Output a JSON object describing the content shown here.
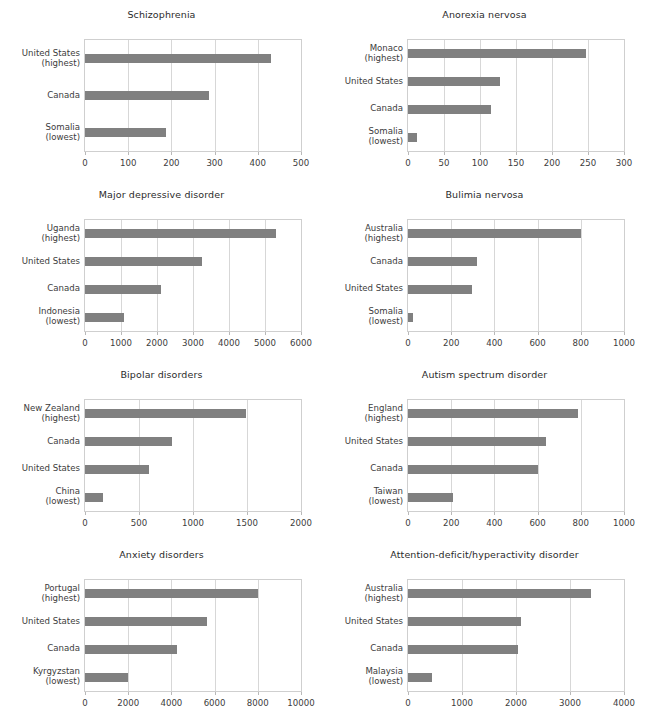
{
  "figure": {
    "bar_color": "#808080",
    "axis_color": "#cfcfcf",
    "grid_color": "#d7d7d7",
    "background": "#ffffff",
    "layout": "4 rows x 2 columns of horizontal bar charts"
  },
  "chart_data": [
    {
      "type": "bar",
      "orientation": "horizontal",
      "title": "Schizophrenia",
      "xlabel": "",
      "ylabel": "",
      "xlim": [
        0,
        500
      ],
      "ticks": [
        0,
        100,
        200,
        300,
        400,
        500
      ],
      "grid": true,
      "legend": "none",
      "categories": [
        "United States\n(highest)",
        "Canada",
        "Somalia\n(lowest)"
      ],
      "category_lines": [
        [
          "United States",
          "(highest)"
        ],
        [
          "Canada",
          ""
        ],
        [
          "Somalia",
          "(lowest)"
        ]
      ],
      "values": [
        430,
        288,
        188
      ]
    },
    {
      "type": "bar",
      "orientation": "horizontal",
      "title": "Anorexia nervosa",
      "xlabel": "",
      "ylabel": "",
      "xlim": [
        0,
        300
      ],
      "ticks": [
        0,
        50,
        100,
        150,
        200,
        250,
        300
      ],
      "grid": true,
      "legend": "none",
      "categories": [
        "Monaco\n(highest)",
        "United States",
        "Canada",
        "Somalia\n(lowest)"
      ],
      "category_lines": [
        [
          "Monaco",
          "(highest)"
        ],
        [
          "United States",
          ""
        ],
        [
          "Canada",
          ""
        ],
        [
          "Somalia",
          "(lowest)"
        ]
      ],
      "values": [
        247,
        128,
        115,
        13
      ]
    },
    {
      "type": "bar",
      "orientation": "horizontal",
      "title": "Major depressive disorder",
      "xlabel": "",
      "ylabel": "",
      "xlim": [
        0,
        6000
      ],
      "ticks": [
        0,
        1000,
        2000,
        3000,
        4000,
        5000,
        6000
      ],
      "grid": true,
      "legend": "none",
      "categories": [
        "Uganda\n(highest)",
        "United States",
        "Canada",
        "Indonesia\n(lowest)"
      ],
      "category_lines": [
        [
          "Uganda",
          "(highest)"
        ],
        [
          "United States",
          ""
        ],
        [
          "Canada",
          ""
        ],
        [
          "Indonesia",
          "(lowest)"
        ]
      ],
      "values": [
        5300,
        3250,
        2120,
        1070
      ]
    },
    {
      "type": "bar",
      "orientation": "horizontal",
      "title": "Bulimia nervosa",
      "xlabel": "",
      "ylabel": "",
      "xlim": [
        0,
        1000
      ],
      "ticks": [
        0,
        200,
        400,
        600,
        800,
        1000
      ],
      "grid": true,
      "legend": "none",
      "categories": [
        "Australia\n(highest)",
        "Canada",
        "United States",
        "Somalia\n(lowest)"
      ],
      "category_lines": [
        [
          "Australia",
          "(highest)"
        ],
        [
          "Canada",
          ""
        ],
        [
          "United States",
          ""
        ],
        [
          "Somalia",
          "(lowest)"
        ]
      ],
      "values": [
        800,
        318,
        295,
        22
      ]
    },
    {
      "type": "bar",
      "orientation": "horizontal",
      "title": "Bipolar disorders",
      "xlabel": "",
      "ylabel": "",
      "xlim": [
        0,
        2000
      ],
      "ticks": [
        0,
        500,
        1000,
        1500,
        2000
      ],
      "grid": true,
      "legend": "none",
      "categories": [
        "New Zealand\n(highest)",
        "Canada",
        "United States",
        "China\n(lowest)"
      ],
      "category_lines": [
        [
          "New Zealand",
          "(highest)"
        ],
        [
          "Canada",
          ""
        ],
        [
          "United States",
          ""
        ],
        [
          "China",
          "(lowest)"
        ]
      ],
      "values": [
        1490,
        805,
        590,
        170
      ]
    },
    {
      "type": "bar",
      "orientation": "horizontal",
      "title": "Autism spectrum disorder",
      "xlabel": "",
      "ylabel": "",
      "xlim": [
        0,
        1000
      ],
      "ticks": [
        0,
        200,
        400,
        600,
        800,
        1000
      ],
      "grid": true,
      "legend": "none",
      "categories": [
        "England\n(highest)",
        "United States",
        "Canada",
        "Taiwan\n(lowest)"
      ],
      "category_lines": [
        [
          "England",
          "(highest)"
        ],
        [
          "United States",
          ""
        ],
        [
          "Canada",
          ""
        ],
        [
          "Taiwan",
          "(lowest)"
        ]
      ],
      "values": [
        785,
        640,
        600,
        210
      ]
    },
    {
      "type": "bar",
      "orientation": "horizontal",
      "title": "Anxiety disorders",
      "xlabel": "",
      "ylabel": "",
      "xlim": [
        0,
        10000
      ],
      "ticks": [
        0,
        2000,
        4000,
        6000,
        8000,
        10000
      ],
      "grid": true,
      "legend": "none",
      "categories": [
        "Portugal\n(highest)",
        "United States",
        "Canada",
        "Kyrgyzstan\n(lowest)"
      ],
      "category_lines": [
        [
          "Portugal",
          "(highest)"
        ],
        [
          "United States",
          ""
        ],
        [
          "Canada",
          ""
        ],
        [
          "Kyrgyzstan",
          "(lowest)"
        ]
      ],
      "values": [
        8000,
        5650,
        4250,
        2000
      ]
    },
    {
      "type": "bar",
      "orientation": "horizontal",
      "title": "Attention-deficit/hyperactivity disorder",
      "xlabel": "",
      "ylabel": "",
      "xlim": [
        0,
        4000
      ],
      "ticks": [
        0,
        1000,
        2000,
        3000,
        4000
      ],
      "grid": true,
      "legend": "none",
      "categories": [
        "Australia\n(highest)",
        "United States",
        "Canada",
        "Malaysia\n(lowest)"
      ],
      "category_lines": [
        [
          "Australia",
          "(highest)"
        ],
        [
          "United States",
          ""
        ],
        [
          "Canada",
          ""
        ],
        [
          "Malaysia",
          "(lowest)"
        ]
      ],
      "values": [
        3380,
        2100,
        2040,
        440
      ]
    }
  ]
}
